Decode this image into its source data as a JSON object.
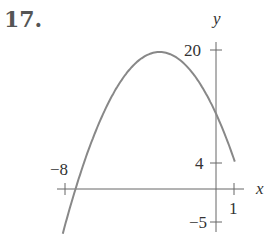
{
  "problem": {
    "number": "17."
  },
  "chart_data": {
    "type": "line",
    "title": "",
    "xlabel": "x",
    "ylabel": "y",
    "function": "y = -(x+3)^2 + 20",
    "x": [
      -8,
      -7,
      -6,
      -5,
      -4,
      -3,
      -2,
      -1,
      0,
      1
    ],
    "values": [
      -5,
      4,
      11,
      16,
      19,
      20,
      19,
      16,
      11,
      4
    ],
    "x_ticks": [
      {
        "value": -8,
        "label": "−8"
      },
      {
        "value": 1,
        "label": "1"
      }
    ],
    "y_ticks": [
      {
        "value": 20,
        "label": "20"
      },
      {
        "value": 4,
        "label": "4"
      },
      {
        "value": -5,
        "label": "−5"
      }
    ],
    "xlim": [
      -8.5,
      1.5
    ],
    "ylim": [
      -7,
      24
    ],
    "grid": false,
    "legend": null,
    "curve_color": "#888888",
    "axis_color": "#555555"
  }
}
